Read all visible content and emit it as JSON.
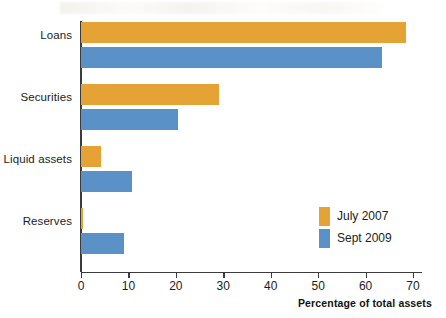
{
  "chart_data": {
    "type": "bar",
    "orientation": "horizontal",
    "title": "",
    "subtitle": "",
    "xlabel": "Percentage of total assets",
    "ylabel": "",
    "categories": [
      "Loans",
      "Securities",
      "Liquid assets",
      "Reserves"
    ],
    "series": [
      {
        "name": "July 2007",
        "color": "#E5A235",
        "values": [
          68.5,
          29.0,
          4.2,
          0.5
        ]
      },
      {
        "name": "Sept 2009",
        "color": "#5A92C8",
        "values": [
          63.5,
          20.5,
          10.8,
          9.0
        ]
      }
    ],
    "xlim": [
      0,
      70
    ],
    "xticks": [
      0,
      10,
      20,
      30,
      40,
      50,
      60,
      70
    ],
    "xtick_labels": [
      "0",
      "10",
      "20",
      "30",
      "40",
      "50",
      "60",
      "70"
    ],
    "grid": false,
    "legend_position": "inside-lower-right",
    "axis_color": "#3c3c3c"
  },
  "legend": {
    "items": [
      {
        "label": "July 2007",
        "color": "#E5A235"
      },
      {
        "label": "Sept 2009",
        "color": "#5A92C8"
      }
    ]
  }
}
